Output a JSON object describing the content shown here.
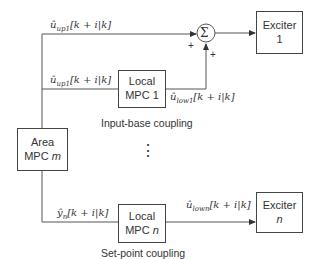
{
  "diagram": {
    "blocks": {
      "exciter1": {
        "line1": "Exciter",
        "line2": "1"
      },
      "local_mpc1": {
        "line1": "Local",
        "line2": "MPC 1"
      },
      "area_mpc": {
        "line1": "Area",
        "line2_prefix": "MPC ",
        "line2_var": "m"
      },
      "local_mpcn": {
        "line1": "Local",
        "line2_prefix": "MPC ",
        "line2_var": "n"
      },
      "excitern": {
        "line1": "Exciter",
        "line2": "n"
      }
    },
    "summing_junction": {
      "symbol": "Σ",
      "sign_left": "+",
      "sign_bottom": "+"
    },
    "signals": {
      "top_up": {
        "base": "û",
        "sub": "up1",
        "arg": "[k + i|k]"
      },
      "mid_up": {
        "base": "û",
        "sub": "up1",
        "arg": "[k + i|k]"
      },
      "low1": {
        "base": "û",
        "sub": "low1",
        "arg": "[k + i|k]"
      },
      "yn": {
        "base": "ŷ",
        "sub": "n",
        "arg": "[k + i|k]"
      },
      "lown": {
        "base": "û",
        "sub": "lown",
        "arg": "[k + i|k]"
      }
    },
    "captions": {
      "input_base": "Input-base coupling",
      "set_point": "Set-point coupling"
    },
    "ellipsis": "⋮"
  }
}
